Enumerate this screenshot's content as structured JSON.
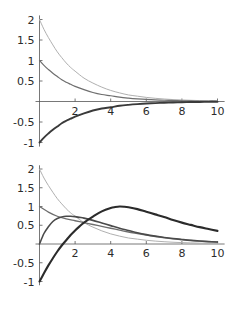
{
  "page": {
    "background_color": "#ffffff",
    "width": 240,
    "height": 310,
    "panel_count": 2
  },
  "chart_data": [
    {
      "id": "plot-1",
      "type": "line",
      "title": "",
      "subtitle": "",
      "xlabel": "",
      "ylabel": "",
      "xlim": [
        0,
        10.4
      ],
      "ylim": [
        -1.1,
        2.1
      ],
      "grid": false,
      "legend": "none",
      "axis_color": "#555555",
      "xticks": [
        2,
        4,
        6,
        8,
        10
      ],
      "xtick_labels": [
        "2",
        "4",
        "6",
        "8",
        "10"
      ],
      "yticks": [
        -1,
        -0.5,
        0.5,
        1,
        1.5,
        2
      ],
      "ytick_labels": [
        "-1",
        "-0.5",
        "0.5",
        "1",
        "1.5",
        "2"
      ],
      "series": [
        {
          "name": "upper-light-decay",
          "color": "#b0b0b0",
          "width": 1.0,
          "x": [
            0,
            0.25,
            0.5,
            0.75,
            1,
            1.25,
            1.5,
            1.75,
            2,
            2.5,
            3,
            3.5,
            4,
            4.5,
            5,
            5.5,
            6,
            6.5,
            7,
            7.5,
            8,
            8.5,
            9,
            9.5,
            10
          ],
          "y": [
            2.0,
            1.76,
            1.56,
            1.38,
            1.21,
            1.07,
            0.94,
            0.83,
            0.74,
            0.57,
            0.45,
            0.35,
            0.27,
            0.21,
            0.16,
            0.13,
            0.1,
            0.078,
            0.061,
            0.047,
            0.037,
            0.029,
            0.022,
            0.017,
            0.013
          ]
        },
        {
          "name": "middle-decay",
          "color": "#6e6e6e",
          "width": 1.2,
          "x": [
            0,
            0.25,
            0.5,
            0.75,
            1,
            1.25,
            1.5,
            1.75,
            2,
            2.5,
            3,
            3.5,
            4,
            4.5,
            5,
            5.5,
            6,
            6.5,
            7,
            7.5,
            8,
            8.5,
            9,
            9.5,
            10
          ],
          "y": [
            1.0,
            0.88,
            0.78,
            0.69,
            0.61,
            0.53,
            0.47,
            0.42,
            0.37,
            0.29,
            0.22,
            0.17,
            0.14,
            0.105,
            0.082,
            0.064,
            0.05,
            0.039,
            0.03,
            0.024,
            0.018,
            0.014,
            0.011,
            0.0086,
            0.0067
          ]
        },
        {
          "name": "lower-negative-decay",
          "color": "#3a3a3a",
          "width": 1.9,
          "x": [
            0,
            0.25,
            0.5,
            0.75,
            1,
            1.25,
            1.5,
            1.75,
            2,
            2.5,
            3,
            3.5,
            4,
            4.5,
            5,
            5.5,
            6,
            6.5,
            7,
            7.5,
            8,
            8.5,
            9,
            9.5,
            10
          ],
          "y": [
            -1.0,
            -0.88,
            -0.78,
            -0.69,
            -0.61,
            -0.53,
            -0.47,
            -0.42,
            -0.37,
            -0.29,
            -0.22,
            -0.17,
            -0.14,
            -0.105,
            -0.082,
            -0.064,
            -0.05,
            -0.039,
            -0.03,
            -0.024,
            -0.018,
            -0.014,
            -0.011,
            -0.0086,
            -0.0067
          ]
        }
      ]
    },
    {
      "id": "plot-2",
      "type": "line",
      "title": "",
      "subtitle": "",
      "xlabel": "",
      "ylabel": "",
      "xlim": [
        0,
        10.4
      ],
      "ylim": [
        -1.1,
        2.1
      ],
      "grid": false,
      "legend": "none",
      "axis_color": "#555555",
      "xticks": [
        2,
        4,
        6,
        8,
        10
      ],
      "xtick_labels": [
        "2",
        "4",
        "6",
        "8",
        "10"
      ],
      "yticks": [
        -1,
        -0.5,
        0.5,
        1,
        1.5,
        2
      ],
      "ytick_labels": [
        "-1",
        "-0.5",
        "0.5",
        "1",
        "1.5",
        "2"
      ],
      "series": [
        {
          "name": "upper-light-decay",
          "color": "#b0b0b0",
          "width": 1.0,
          "x": [
            0,
            0.25,
            0.5,
            0.75,
            1,
            1.25,
            1.5,
            1.75,
            2,
            2.5,
            3,
            3.5,
            4,
            4.5,
            5,
            5.5,
            6,
            6.5,
            7,
            7.5,
            8,
            8.5,
            9,
            9.5,
            10
          ],
          "y": [
            2.0,
            1.76,
            1.56,
            1.38,
            1.21,
            1.07,
            0.94,
            0.83,
            0.74,
            0.57,
            0.45,
            0.35,
            0.27,
            0.21,
            0.16,
            0.13,
            0.1,
            0.078,
            0.061,
            0.047,
            0.037,
            0.029,
            0.022,
            0.017,
            0.013
          ]
        },
        {
          "name": "middle-decay",
          "color": "#6e6e6e",
          "width": 1.3,
          "x": [
            0,
            0.5,
            1,
            1.5,
            2,
            2.5,
            3,
            3.5,
            4,
            4.5,
            5,
            5.5,
            6,
            6.5,
            7,
            7.5,
            8,
            8.5,
            9,
            9.5,
            10
          ],
          "y": [
            1.0,
            0.85,
            0.74,
            0.67,
            0.62,
            0.57,
            0.52,
            0.47,
            0.42,
            0.37,
            0.32,
            0.28,
            0.24,
            0.2,
            0.17,
            0.14,
            0.115,
            0.095,
            0.077,
            0.063,
            0.05
          ]
        },
        {
          "name": "rising-hump",
          "color": "#4a4a4a",
          "width": 1.6,
          "x": [
            0,
            0.25,
            0.5,
            0.75,
            1,
            1.25,
            1.5,
            1.75,
            2,
            2.25,
            2.5,
            3,
            3.5,
            4,
            4.5,
            5,
            5.5,
            6,
            6.5,
            7,
            7.5,
            8,
            8.5,
            9,
            9.5,
            10
          ],
          "y": [
            0.0,
            0.28,
            0.46,
            0.6,
            0.68,
            0.72,
            0.74,
            0.74,
            0.73,
            0.71,
            0.69,
            0.63,
            0.56,
            0.49,
            0.42,
            0.36,
            0.3,
            0.25,
            0.21,
            0.175,
            0.145,
            0.12,
            0.097,
            0.079,
            0.064,
            0.052
          ]
        },
        {
          "name": "delayed-peak",
          "color": "#2b2b2b",
          "width": 2.1,
          "x": [
            0,
            0.25,
            0.5,
            0.75,
            1,
            1.25,
            1.5,
            1.75,
            2,
            2.25,
            2.5,
            3,
            3.5,
            4,
            4.25,
            4.5,
            4.75,
            5,
            5.5,
            6,
            6.5,
            7,
            7.5,
            8,
            8.5,
            9,
            9.5,
            10
          ],
          "y": [
            -1.0,
            -0.78,
            -0.57,
            -0.38,
            -0.2,
            -0.04,
            0.1,
            0.24,
            0.36,
            0.47,
            0.57,
            0.73,
            0.87,
            0.96,
            0.985,
            1.0,
            0.995,
            0.98,
            0.93,
            0.86,
            0.79,
            0.72,
            0.64,
            0.57,
            0.51,
            0.45,
            0.4,
            0.35
          ]
        }
      ]
    }
  ]
}
